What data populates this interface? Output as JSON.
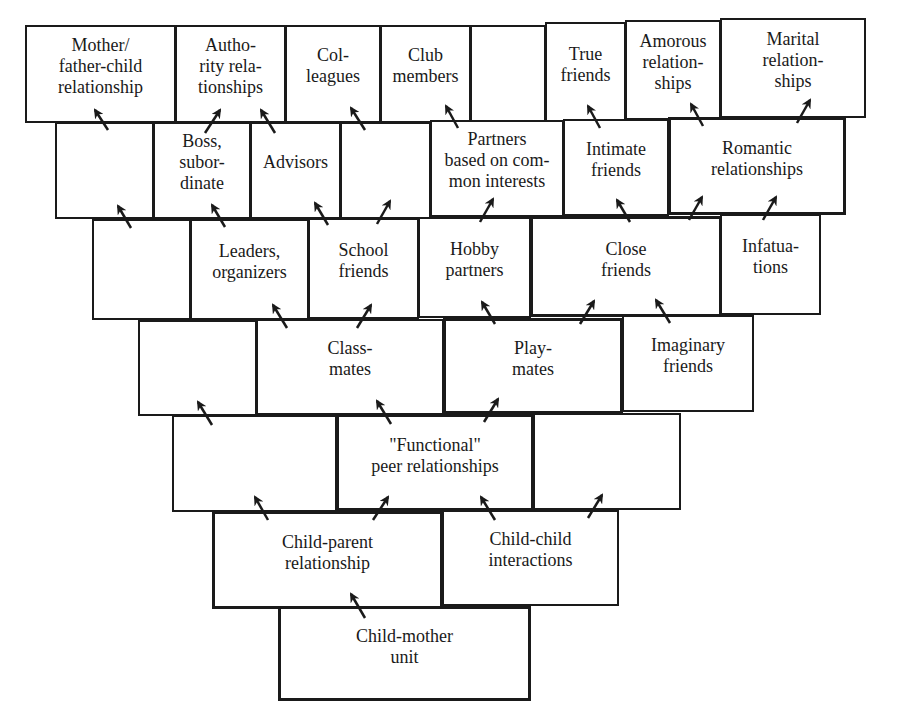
{
  "diagram": {
    "type": "developmental-hierarchy",
    "colors": {
      "line": "#1a1a1a",
      "background": "#ffffff"
    },
    "rows": [
      {
        "row": 1,
        "boxes": [
          {
            "id": "mother-father-child",
            "label": "Mother/\nfather-child\nrelationship",
            "x": 25,
            "y": 25,
            "w": 151,
            "h": 98,
            "bold": false
          },
          {
            "id": "authority",
            "label": "Autho-\nrity rela-\ntionships",
            "x": 175,
            "y": 25,
            "w": 111,
            "h": 98,
            "bold": false
          },
          {
            "id": "colleagues",
            "label": "Col-\nleagues",
            "x": 285,
            "y": 25,
            "w": 96,
            "h": 98,
            "bold": false
          },
          {
            "id": "club-members",
            "label": "Club\nmembers",
            "x": 380,
            "y": 25,
            "w": 91,
            "h": 98,
            "bold": false
          },
          {
            "id": "row1-empty",
            "label": "",
            "x": 470,
            "y": 25,
            "w": 76,
            "h": 98,
            "bold": false
          },
          {
            "id": "true-friends",
            "label": "True\nfriends",
            "x": 545,
            "y": 22,
            "w": 81,
            "h": 101,
            "bold": false
          },
          {
            "id": "amorous",
            "label": "Amorous\nrelation-\nships",
            "x": 625,
            "y": 20,
            "w": 96,
            "h": 100,
            "bold": false
          },
          {
            "id": "marital",
            "label": "Marital\nrelation-\nships",
            "x": 720,
            "y": 18,
            "w": 146,
            "h": 100,
            "bold": false
          }
        ]
      },
      {
        "row": 2,
        "boxes": [
          {
            "id": "row2-empty-a",
            "label": "",
            "x": 55,
            "y": 122,
            "w": 99,
            "h": 97,
            "bold": false
          },
          {
            "id": "boss-subordinate",
            "label": "Boss,\nsubor-\ndinate",
            "x": 153,
            "y": 122,
            "w": 98,
            "h": 97,
            "bold": false
          },
          {
            "id": "advisors",
            "label": "Advisors",
            "x": 250,
            "y": 122,
            "w": 91,
            "h": 97,
            "bold": false
          },
          {
            "id": "row2-empty-b",
            "label": "",
            "x": 340,
            "y": 122,
            "w": 91,
            "h": 97,
            "bold": false
          },
          {
            "id": "partners-common-interests",
            "label": "Partners\nbased on com-\nmon interests",
            "x": 430,
            "y": 120,
            "w": 134,
            "h": 97,
            "bold": false
          },
          {
            "id": "intimate-friends",
            "label": "Intimate\nfriends",
            "x": 563,
            "y": 119,
            "w": 106,
            "h": 97,
            "bold": false
          },
          {
            "id": "romantic",
            "label": "Romantic\nrelationships",
            "x": 668,
            "y": 117,
            "w": 178,
            "h": 98,
            "bold": true
          }
        ]
      },
      {
        "row": 3,
        "boxes": [
          {
            "id": "row3-empty",
            "label": "",
            "x": 92,
            "y": 219,
            "w": 99,
            "h": 101,
            "bold": false
          },
          {
            "id": "leaders-organizers",
            "label": "Leaders,\norganizers",
            "x": 190,
            "y": 219,
            "w": 119,
            "h": 101,
            "bold": false
          },
          {
            "id": "school-friends",
            "label": "School\nfriends",
            "x": 308,
            "y": 218,
            "w": 111,
            "h": 101,
            "bold": false
          },
          {
            "id": "hobby-partners",
            "label": "Hobby\npartners",
            "x": 418,
            "y": 217,
            "w": 113,
            "h": 101,
            "bold": false
          },
          {
            "id": "close-friends",
            "label": "Close\nfriends",
            "x": 530,
            "y": 216,
            "w": 192,
            "h": 101,
            "bold": true
          },
          {
            "id": "infatuations",
            "label": "Infatua-\ntions",
            "x": 720,
            "y": 214,
            "w": 101,
            "h": 101,
            "bold": false
          }
        ]
      },
      {
        "row": 4,
        "boxes": [
          {
            "id": "row4-empty",
            "label": "",
            "x": 138,
            "y": 320,
            "w": 119,
            "h": 96,
            "bold": false
          },
          {
            "id": "classmates",
            "label": "Class-\nmates",
            "x": 256,
            "y": 319,
            "w": 188,
            "h": 96,
            "bold": false
          },
          {
            "id": "playmates",
            "label": "Play-\nmates",
            "x": 443,
            "y": 318,
            "w": 180,
            "h": 96,
            "bold": true
          },
          {
            "id": "imaginary-friends",
            "label": "Imaginary\nfriends",
            "x": 622,
            "y": 315,
            "w": 132,
            "h": 97,
            "bold": false
          }
        ]
      },
      {
        "row": 5,
        "boxes": [
          {
            "id": "row5-empty-a",
            "label": "",
            "x": 172,
            "y": 415,
            "w": 165,
            "h": 97,
            "bold": false
          },
          {
            "id": "functional-peer",
            "label": "\"Functional\"\npeer relationships",
            "x": 336,
            "y": 414,
            "w": 198,
            "h": 97,
            "bold": true
          },
          {
            "id": "row5-empty-b",
            "label": "",
            "x": 533,
            "y": 413,
            "w": 148,
            "h": 97,
            "bold": false
          }
        ]
      },
      {
        "row": 6,
        "boxes": [
          {
            "id": "child-parent",
            "label": "Child-parent\nrelationship",
            "x": 212,
            "y": 511,
            "w": 231,
            "h": 98,
            "bold": true
          },
          {
            "id": "child-child",
            "label": "Child-child\ninteractions",
            "x": 442,
            "y": 510,
            "w": 177,
            "h": 96,
            "bold": false
          }
        ]
      },
      {
        "row": 7,
        "boxes": [
          {
            "id": "child-mother-unit",
            "label": "Child-mother\nunit",
            "x": 278,
            "y": 606,
            "w": 253,
            "h": 95,
            "bold": true
          }
        ]
      }
    ],
    "arrows": [
      {
        "x1": 108,
        "y1": 130,
        "x2": 95,
        "y2": 110
      },
      {
        "x1": 205,
        "y1": 133,
        "x2": 220,
        "y2": 110
      },
      {
        "x1": 275,
        "y1": 133,
        "x2": 261,
        "y2": 110
      },
      {
        "x1": 365,
        "y1": 130,
        "x2": 351,
        "y2": 108
      },
      {
        "x1": 458,
        "y1": 128,
        "x2": 446,
        "y2": 106
      },
      {
        "x1": 600,
        "y1": 128,
        "x2": 588,
        "y2": 106
      },
      {
        "x1": 703,
        "y1": 126,
        "x2": 691,
        "y2": 104
      },
      {
        "x1": 797,
        "y1": 123,
        "x2": 810,
        "y2": 100
      },
      {
        "x1": 131,
        "y1": 228,
        "x2": 118,
        "y2": 206
      },
      {
        "x1": 225,
        "y1": 227,
        "x2": 212,
        "y2": 205
      },
      {
        "x1": 328,
        "y1": 225,
        "x2": 315,
        "y2": 203
      },
      {
        "x1": 377,
        "y1": 224,
        "x2": 390,
        "y2": 201
      },
      {
        "x1": 480,
        "y1": 222,
        "x2": 493,
        "y2": 199
      },
      {
        "x1": 630,
        "y1": 222,
        "x2": 617,
        "y2": 200
      },
      {
        "x1": 689,
        "y1": 220,
        "x2": 702,
        "y2": 197
      },
      {
        "x1": 763,
        "y1": 220,
        "x2": 776,
        "y2": 197
      },
      {
        "x1": 212,
        "y1": 425,
        "x2": 198,
        "y2": 402
      },
      {
        "x1": 287,
        "y1": 328,
        "x2": 273,
        "y2": 305
      },
      {
        "x1": 357,
        "y1": 328,
        "x2": 371,
        "y2": 305
      },
      {
        "x1": 495,
        "y1": 324,
        "x2": 482,
        "y2": 302
      },
      {
        "x1": 580,
        "y1": 324,
        "x2": 594,
        "y2": 301
      },
      {
        "x1": 670,
        "y1": 323,
        "x2": 656,
        "y2": 300
      },
      {
        "x1": 268,
        "y1": 520,
        "x2": 255,
        "y2": 497
      },
      {
        "x1": 391,
        "y1": 424,
        "x2": 377,
        "y2": 401
      },
      {
        "x1": 484,
        "y1": 422,
        "x2": 498,
        "y2": 399
      },
      {
        "x1": 373,
        "y1": 520,
        "x2": 388,
        "y2": 497
      },
      {
        "x1": 495,
        "y1": 520,
        "x2": 481,
        "y2": 497
      },
      {
        "x1": 588,
        "y1": 518,
        "x2": 602,
        "y2": 495
      },
      {
        "x1": 365,
        "y1": 618,
        "x2": 351,
        "y2": 594
      }
    ]
  }
}
